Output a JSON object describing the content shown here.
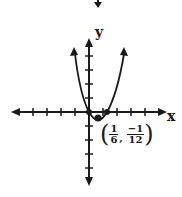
{
  "diagram": {
    "type": "coordinate-plane-parabola",
    "x_axis_label": "x",
    "y_axis_label": "y",
    "vertex_label": {
      "x_num": "1",
      "x_den": "6",
      "separator": ",",
      "y_num": "−1",
      "y_den": "12"
    },
    "curve": "parabola opening upward",
    "roots": [
      0,
      "1/3"
    ],
    "vertex": [
      "1/6",
      "-1/12"
    ],
    "colors": {
      "ink": "#1a1a1a",
      "background": "#ffffff"
    }
  }
}
